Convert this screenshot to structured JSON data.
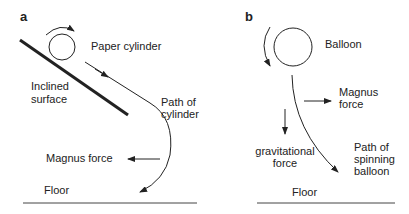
{
  "panels": [
    {
      "id": "a",
      "label": "a",
      "object_label": "Paper cylinder",
      "surface_label_1": "Inclined",
      "surface_label_2": "surface",
      "path_label_1": "Path of",
      "path_label_2": "cylinder",
      "force_label": "Magnus force",
      "floor_label": "Floor"
    },
    {
      "id": "b",
      "label": "b",
      "object_label": "Balloon",
      "force_label_1": "Magnus",
      "force_label_2": "force",
      "gravity_label_1": "gravitational",
      "gravity_label_2": "force",
      "path_label_1": "Path of",
      "path_label_2": "spinning",
      "path_label_3": "balloon",
      "floor_label": "Floor"
    }
  ],
  "colors": {
    "ink": "#222222",
    "background": "#ffffff"
  }
}
